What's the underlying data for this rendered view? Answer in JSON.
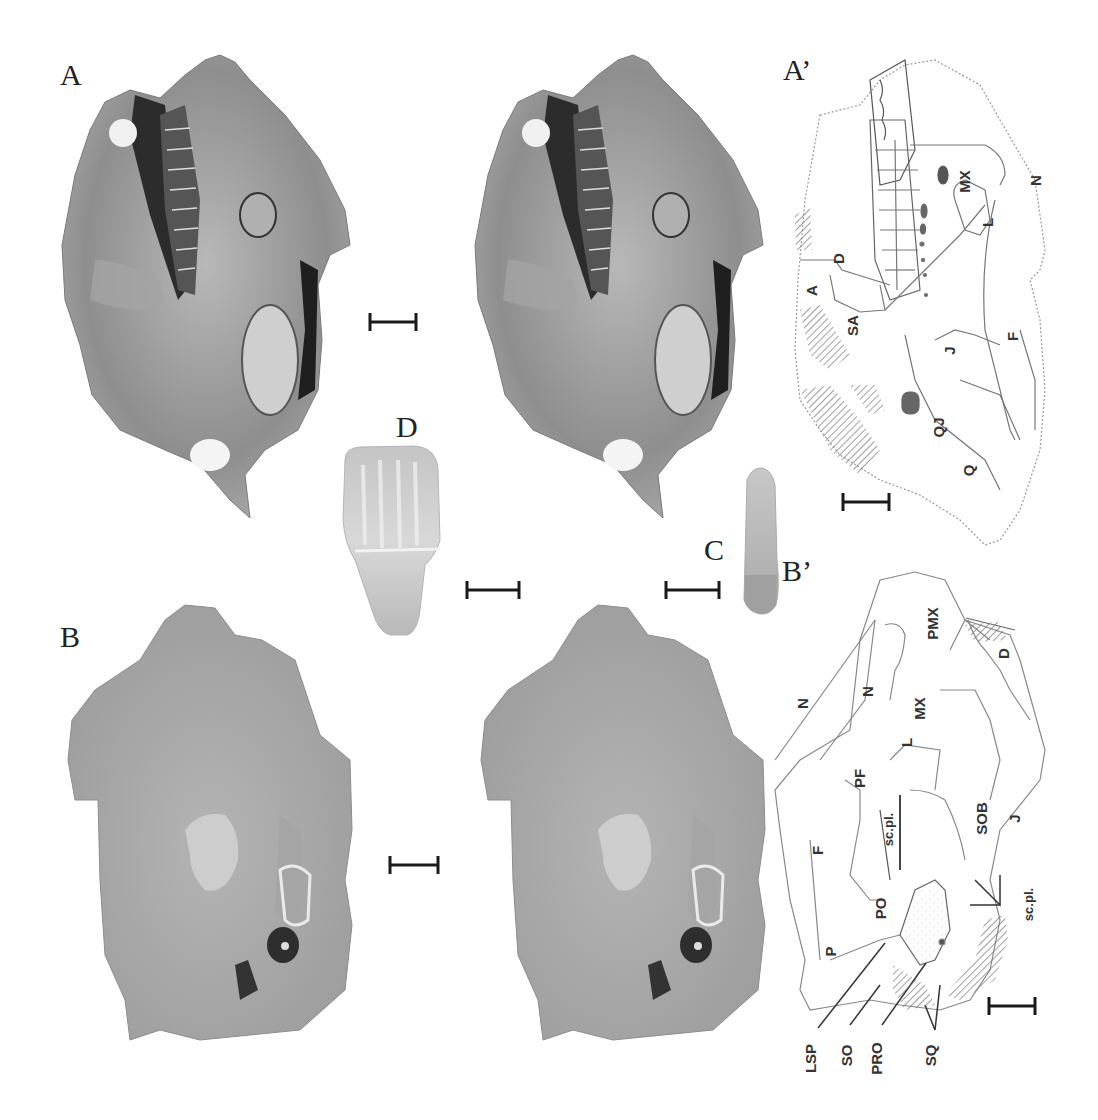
{
  "figure": {
    "panels": [
      {
        "id": "A",
        "letter": "A",
        "description": "Skull specimen, lateral view (photograph, stereo pair left)"
      },
      {
        "id": "A-stereo",
        "letter": "",
        "description": "Skull specimen, lateral view (photograph, stereo pair right)"
      },
      {
        "id": "A-prime",
        "letter": "A’",
        "description": "Interpretive line drawing of skull, lateral view"
      },
      {
        "id": "B",
        "letter": "B",
        "description": "Skull specimen, dorsal/oblique view (photograph, stereo pair left)"
      },
      {
        "id": "B-stereo",
        "letter": "",
        "description": "Skull specimen, dorsal/oblique view (photograph, stereo pair right)"
      },
      {
        "id": "B-prime",
        "letter": "B’",
        "description": "Interpretive line drawing of skull, dorsal/oblique view"
      },
      {
        "id": "C",
        "letter": "C",
        "description": "Isolated tooth, elongate"
      },
      {
        "id": "D",
        "letter": "D",
        "description": "Isolated tooth crown, broad"
      }
    ],
    "a_prime_labels": [
      "MX",
      "N",
      "L",
      "D",
      "A",
      "SA",
      "J",
      "F",
      "QJ",
      "Q"
    ],
    "b_prime_labels": [
      "PMX",
      "D",
      "N",
      "N",
      "MX",
      "L",
      "PF",
      "sc.pl.",
      "SOB",
      "J",
      "F",
      "PO",
      "sc.pl.",
      "P",
      "LSP",
      "SO",
      "PRO",
      "SQ"
    ],
    "colors": {
      "background": "#ffffff",
      "ink": "#1a1a1a",
      "label": "#333333",
      "photo_tone": "#9a9a9a",
      "hatch": "#888888"
    }
  }
}
